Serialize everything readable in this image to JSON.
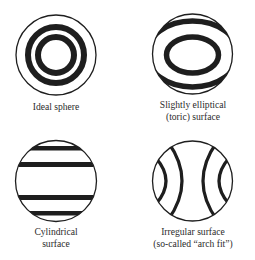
{
  "figure": {
    "panels": [
      {
        "id": "ideal-sphere",
        "lines": [
          "Ideal sphere"
        ]
      },
      {
        "id": "toric-surface",
        "lines": [
          "Slightly elliptical",
          "(toric) surface"
        ]
      },
      {
        "id": "cylindrical-surface",
        "lines": [
          "Cylindrical",
          "surface"
        ]
      },
      {
        "id": "irregular-surface",
        "lines": [
          "Irregular surface",
          "(so-called “arch fit”)"
        ]
      }
    ],
    "colors": {
      "ink": "#1e1e1e",
      "background": "#ffffff"
    }
  }
}
